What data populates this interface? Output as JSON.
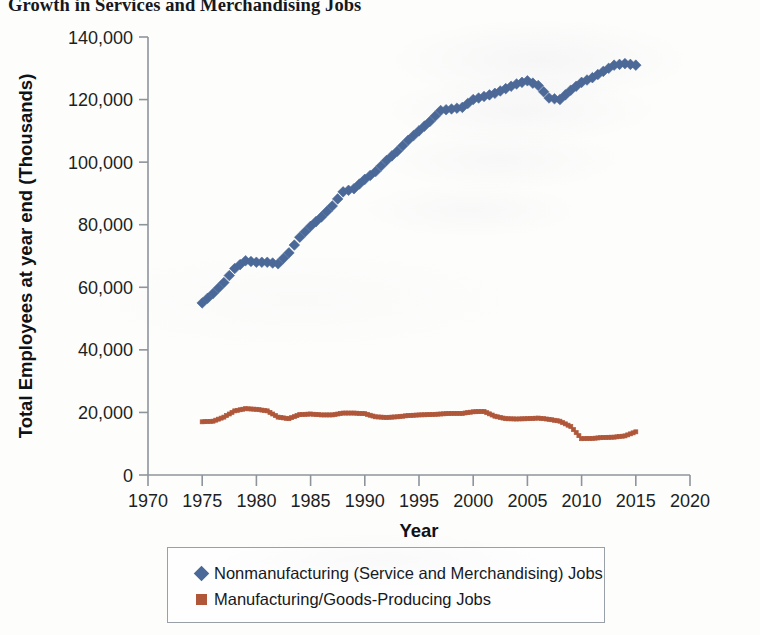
{
  "chart_data": {
    "type": "line",
    "title": "Growth in Services and Merchandising Jobs",
    "xlabel": "Year",
    "ylabel": "Total Employees at year end (Thousands)",
    "xlim": [
      1970,
      2020
    ],
    "ylim": [
      0,
      140000
    ],
    "xticks": [
      1970,
      1975,
      1980,
      1985,
      1990,
      1995,
      2000,
      2005,
      2010,
      2015,
      2020
    ],
    "xtick_labels": [
      "1970",
      "1975",
      "1980",
      "1985",
      "1990",
      "1995",
      "2000",
      "2005",
      "2010",
      "2015",
      "2020"
    ],
    "yticks": [
      0,
      20000,
      40000,
      60000,
      80000,
      100000,
      120000,
      140000
    ],
    "ytick_labels": [
      "0",
      "20,000",
      "40,000",
      "60,000",
      "80,000",
      "100,000",
      "120,000",
      "140,000"
    ],
    "grid": false,
    "legend_position": "below",
    "x": [
      1975,
      1976,
      1977,
      1978,
      1979,
      1980,
      1981,
      1982,
      1983,
      1984,
      1985,
      1986,
      1987,
      1988,
      1989,
      1990,
      1991,
      1992,
      1993,
      1994,
      1995,
      1996,
      1997,
      1998,
      1999,
      2000,
      2001,
      2002,
      2003,
      2004,
      2005,
      2006,
      2007,
      2008,
      2009,
      2010,
      2011,
      2012,
      2013,
      2014,
      2015
    ],
    "series": [
      {
        "name": "Nonmanufacturing (Service and Merchandising) Jobs",
        "marker": "diamond",
        "color": "#4a6898",
        "values": [
          55000,
          58000,
          61500,
          66000,
          68500,
          68000,
          68000,
          67500,
          71000,
          76000,
          79500,
          82500,
          86000,
          90500,
          91500,
          94500,
          97000,
          100500,
          103500,
          107000,
          110000,
          113000,
          116500,
          117000,
          117500,
          120000,
          121000,
          122000,
          123500,
          125000,
          126000,
          124500,
          120500,
          120000,
          123000,
          125500,
          127000,
          129000,
          131000,
          131500,
          131000
        ]
      },
      {
        "name": "Manufacturing/Goods-Producing Jobs",
        "marker": "square",
        "color": "#b0573a",
        "values": [
          17000,
          17200,
          18500,
          20500,
          21200,
          21000,
          20500,
          18500,
          18000,
          19300,
          19500,
          19200,
          19200,
          19800,
          19800,
          19600,
          18600,
          18400,
          18600,
          19000,
          19200,
          19300,
          19500,
          19700,
          19700,
          20200,
          20300,
          18800,
          18000,
          17900,
          18000,
          18200,
          17800,
          17200,
          15500,
          11600,
          11700,
          12000,
          12100,
          12500,
          13800
        ]
      }
    ]
  },
  "legend": {
    "items": [
      {
        "label": "Nonmanufacturing (Service and Merchandising) Jobs",
        "marker": "diamond",
        "color": "#4a6898"
      },
      {
        "label": "Manufacturing/Goods-Producing Jobs",
        "marker": "square",
        "color": "#b0573a"
      }
    ]
  }
}
